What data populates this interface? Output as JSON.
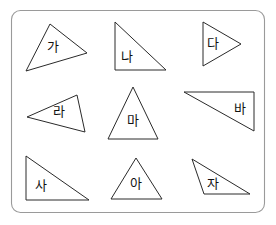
{
  "worksheet": {
    "title": "Triangle shapes worksheet",
    "background_color": "#ffffff",
    "panel": {
      "name": "rounded-rectangle-panel",
      "x": 11.5,
      "y": 10.5,
      "width": 253,
      "height": 202,
      "corner_radius": 9,
      "stroke_color": "#9a9a9a",
      "fill_color": "#ffffff"
    },
    "shape_stroke_color": "#2a2a2a",
    "label_color": "#111111",
    "shapes": [
      {
        "id": "triangle-ga",
        "label": "가",
        "kind": "scalene-triangle",
        "points": "50,24 87,53 26,71",
        "label_x": 53,
        "label_y": 47
      },
      {
        "id": "triangle-na",
        "label": "나",
        "kind": "right-triangle",
        "points": "115,22 115,70 166,70",
        "label_x": 127,
        "label_y": 57
      },
      {
        "id": "triangle-da",
        "label": "다",
        "kind": "isosceles-triangle-pointing-right",
        "points": "203,22 241,44 203,66",
        "label_x": 213,
        "label_y": 44
      },
      {
        "id": "triangle-ra",
        "label": "라",
        "kind": "scalene-triangle-pointing-left",
        "points": "27,117 77,95 85,132",
        "label_x": 59,
        "label_y": 112
      },
      {
        "id": "triangle-ma",
        "label": "마",
        "kind": "isosceles-triangle",
        "points": "133,87 158,139 108,139",
        "label_x": 133,
        "label_y": 121
      },
      {
        "id": "triangle-ba",
        "label": "바",
        "kind": "right-triangle",
        "points": "184,92 254,92 254,131",
        "label_x": 240,
        "label_y": 109
      },
      {
        "id": "triangle-sa",
        "label": "사",
        "kind": "right-triangle",
        "points": "26,156 26,200 89,200",
        "label_x": 41,
        "label_y": 186
      },
      {
        "id": "triangle-a",
        "label": "아",
        "kind": "isosceles-triangle",
        "points": "136,158 162,199 111,199",
        "label_x": 136,
        "label_y": 184
      },
      {
        "id": "triangle-ja",
        "label": "자",
        "kind": "obtuse-triangle",
        "points": "192,159 250,194 204,194",
        "label_x": 213,
        "label_y": 184
      }
    ]
  }
}
